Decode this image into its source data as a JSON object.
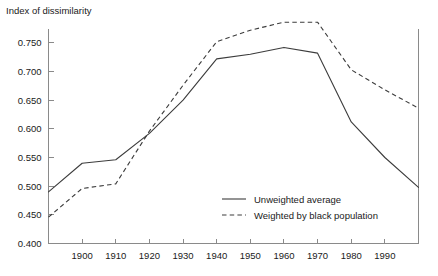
{
  "chart_data": {
    "type": "line",
    "title": "Index of dissimilarity",
    "xlabel": "",
    "ylabel": "Index of dissimilarity",
    "x": [
      1890,
      1900,
      1910,
      1920,
      1930,
      1940,
      1950,
      1960,
      1970,
      1980,
      1990,
      2000
    ],
    "categories": [
      "1900",
      "1910",
      "1920",
      "1930",
      "1940",
      "1950",
      "1960",
      "1970",
      "1980",
      "1990"
    ],
    "xtick_labels": [
      "1900",
      "1910",
      "1920",
      "1930",
      "1940",
      "1950",
      "1960",
      "1970",
      "1980",
      "1990"
    ],
    "xtick_values": [
      1900,
      1910,
      1920,
      1930,
      1940,
      1950,
      1960,
      1970,
      1980,
      1990
    ],
    "ytick_labels": [
      "0.400",
      "0.450",
      "0.500",
      "0.550",
      "0.600",
      "0.650",
      "0.700",
      "0.750"
    ],
    "ytick_values": [
      0.4,
      0.45,
      0.5,
      0.55,
      0.6,
      0.65,
      0.7,
      0.75
    ],
    "xlim": [
      1890,
      2000
    ],
    "ylim": [
      0.4,
      0.775
    ],
    "grid": false,
    "legend_position": "center-right-inside",
    "series": [
      {
        "name": "Unweighted average",
        "style": "solid",
        "color": "#3c3c3c",
        "x": [
          1890,
          1900,
          1910,
          1920,
          1930,
          1940,
          1950,
          1960,
          1970,
          1980,
          1990,
          2000
        ],
        "values": [
          0.49,
          0.54,
          0.546,
          0.592,
          0.65,
          0.722,
          0.73,
          0.742,
          0.732,
          0.612,
          0.55,
          0.498
        ]
      },
      {
        "name": "Weighted by black population",
        "style": "dashed",
        "color": "#3c3c3c",
        "x": [
          1890,
          1900,
          1910,
          1920,
          1930,
          1940,
          1950,
          1960,
          1970,
          1980,
          1990,
          2000
        ],
        "values": [
          0.446,
          0.496,
          0.504,
          0.596,
          0.676,
          0.752,
          0.772,
          0.786,
          0.786,
          0.703,
          0.668,
          0.636
        ]
      }
    ]
  },
  "legend": {
    "items": [
      {
        "label": "Unweighted average",
        "style": "solid"
      },
      {
        "label": "Weighted by black population",
        "style": "dashed"
      }
    ]
  }
}
